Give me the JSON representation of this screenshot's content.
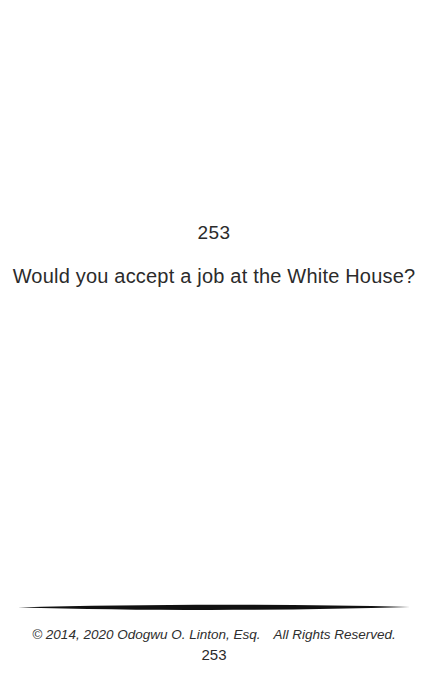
{
  "page": {
    "question_number": "253",
    "question": "Would you accept a job at the White House?",
    "footer": {
      "copyright_left": "© 2014, 2020 Odogwu O. Linton, Esq.",
      "copyright_right": "All Rights Reserved.",
      "page_number": "253"
    },
    "colors": {
      "background": "#ffffff",
      "text": "#2b2b2b",
      "divider": "#111111"
    }
  }
}
